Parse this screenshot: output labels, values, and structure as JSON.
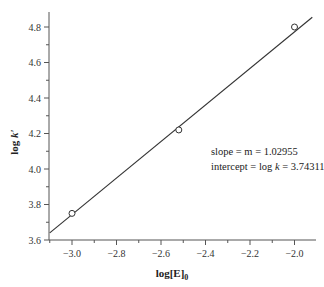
{
  "chart_data": {
    "type": "scatter",
    "title": "",
    "xlabel": "log[E]₀",
    "ylabel": "log k′",
    "xlim": [
      -3.1,
      -1.9
    ],
    "ylim": [
      3.6,
      4.9
    ],
    "xticks": [
      -3.0,
      -2.8,
      -2.6,
      -2.4,
      -2.2,
      -2.0
    ],
    "xtick_labels": [
      "−3.0",
      "−2.8",
      "−2.6",
      "−2.4",
      "−2.2",
      "−2.0"
    ],
    "yticks": [
      3.6,
      3.8,
      4.0,
      4.2,
      4.4,
      4.6,
      4.8
    ],
    "ytick_labels": [
      "3.6",
      "3.8",
      "4.0",
      "4.2",
      "4.4",
      "4.6",
      "4.8"
    ],
    "grid": false,
    "legend": null,
    "series": [
      {
        "name": "data",
        "marker": "open-circle",
        "x": [
          -3.0,
          -2.52,
          -2.0
        ],
        "y": [
          3.75,
          4.22,
          4.8
        ]
      },
      {
        "name": "linear fit",
        "style": "line",
        "slope": 1.02955,
        "intercept": 3.74311,
        "note": "line computed as y = intercept + slope*(x+3)"
      }
    ],
    "annotations": [
      "slope = m = 1.02955",
      "intercept = log k = 3.74311"
    ]
  },
  "labels": {
    "xlabel_main": "log[E]",
    "xlabel_sub": "0",
    "ylabel_main": "log ",
    "ylabel_italic": "k′",
    "annot_slope": "slope = m = 1.02955",
    "annot_intercept_pre": "intercept = log ",
    "annot_intercept_k": "k",
    "annot_intercept_post": " = 3.74311"
  }
}
